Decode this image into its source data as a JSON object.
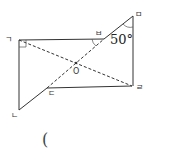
{
  "figure": {
    "labels": {
      "giyeok": "ㄱ",
      "nieun": "ㄴ",
      "digeut": "ㄷ",
      "rieul": "ㄹ",
      "mieum": "ㅁ",
      "bieup": "ㅂ",
      "center": "O"
    },
    "angle_label": "50°",
    "colors": {
      "line": "#333333",
      "background": "#ffffff"
    }
  },
  "answer_blank": "("
}
